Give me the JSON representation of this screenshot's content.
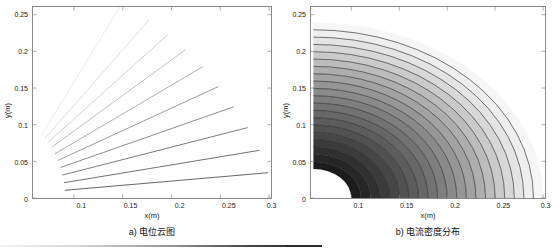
{
  "figure": {
    "width": 557,
    "height": 249,
    "background": "#ffffff",
    "line_color": "#3c3c3c",
    "axis_color": "#8a8a8a",
    "text_color": "#1a1a1a"
  },
  "panels": [
    {
      "id": "a",
      "caption": "a) 电位云图",
      "xlabel": "x(m)",
      "ylabel": "y(m)",
      "xticks": [
        "0.1",
        "0.15",
        "0.2",
        "0.25",
        "0.3"
      ],
      "yticks": [
        "0",
        "0.05",
        "0.1",
        "0.15",
        "0.2",
        "0.25"
      ]
    },
    {
      "id": "b",
      "caption": "b) 电流密度分布",
      "xlabel": "x(m)",
      "ylabel": "y(m)",
      "xticks": [
        "0.1",
        "0.15",
        "0.2",
        "0.25",
        "0.3"
      ],
      "yticks": [
        "0",
        "0.05",
        "0.1",
        "0.15",
        "0.2",
        "0.25"
      ]
    }
  ],
  "chart_data": [
    {
      "type": "line",
      "title": "a) 电位云图",
      "xlabel": "x(m)",
      "ylabel": "y(m)",
      "xlim": [
        0.058,
        0.302
      ],
      "ylim": [
        0.0,
        0.2605
      ],
      "grid": false,
      "legend": "none",
      "description": "Equipotential / field lines: ten straight rays fanning out from a common source region near the inner electrode radius; line gray value lightens with increasing angle.",
      "origin": [
        0.0605,
        0.0
      ],
      "inner_radius": 0.0305,
      "series": [
        {
          "name": "ray-1",
          "angle_deg": 8,
          "gray": "#4a4a4a",
          "x": [
            0.0905,
            0.299
          ],
          "y": [
            0.0105,
            0.0345
          ]
        },
        {
          "name": "ray-2",
          "angle_deg": 16,
          "gray": "#565656",
          "x": [
            0.0897,
            0.29
          ],
          "y": [
            0.0208,
            0.065
          ]
        },
        {
          "name": "ray-3",
          "angle_deg": 25,
          "gray": "#646464",
          "x": [
            0.0882,
            0.278
          ],
          "y": [
            0.0313,
            0.096
          ]
        },
        {
          "name": "ray-4",
          "angle_deg": 33,
          "gray": "#757575",
          "x": [
            0.0862,
            0.264
          ],
          "y": [
            0.0416,
            0.1245
          ]
        },
        {
          "name": "ray-5",
          "angle_deg": 41,
          "gray": "#8a8a8a",
          "x": [
            0.0835,
            0.248
          ],
          "y": [
            0.0512,
            0.152
          ]
        },
        {
          "name": "ray-6",
          "angle_deg": 49,
          "gray": "#a0a0a0",
          "x": [
            0.0805,
            0.232
          ],
          "y": [
            0.0603,
            0.179
          ]
        },
        {
          "name": "ray-7",
          "angle_deg": 57,
          "gray": "#b4b4b4",
          "x": [
            0.077,
            0.214
          ],
          "y": [
            0.069,
            0.202
          ]
        },
        {
          "name": "ray-8",
          "angle_deg": 65,
          "gray": "#c8c8c8",
          "x": [
            0.0735,
            0.196
          ],
          "y": [
            0.076,
            0.2225
          ]
        },
        {
          "name": "ray-9",
          "angle_deg": 72,
          "gray": "#d8d8d8",
          "x": [
            0.07,
            0.177
          ],
          "y": [
            0.081,
            0.243
          ]
        },
        {
          "name": "ray-10",
          "angle_deg": 80,
          "gray": "#e6e6e6",
          "x": [
            0.0665,
            0.147
          ],
          "y": [
            0.085,
            0.2605
          ]
        }
      ]
    },
    {
      "type": "contour",
      "title": "b) 电流密度分布",
      "xlabel": "x(m)",
      "ylabel": "y(m)",
      "xlim": [
        0.058,
        0.302
      ],
      "ylim": [
        0.0,
        0.2605
      ],
      "grid": false,
      "legend": "none",
      "description": "Filled contour map of current density over a quarter-annulus sector. Density is highest (darkest) at the inner electrode radius and decays monotonically outward to near-white at the outer boundary. Twenty concentric arc contour lines are overlaid.",
      "center": [
        0.0605,
        0.0
      ],
      "inner_radius": 0.0395,
      "outer_radius": 0.2395,
      "angle_range_deg": [
        0,
        90
      ],
      "n_contour_lines": 20,
      "bands": [
        {
          "r_outer": 0.0495,
          "fill": "#1c1c1c"
        },
        {
          "r_outer": 0.0595,
          "fill": "#262626"
        },
        {
          "r_outer": 0.0695,
          "fill": "#303030"
        },
        {
          "r_outer": 0.0795,
          "fill": "#3b3b3b"
        },
        {
          "r_outer": 0.0895,
          "fill": "#464646"
        },
        {
          "r_outer": 0.0995,
          "fill": "#515151"
        },
        {
          "r_outer": 0.1095,
          "fill": "#5c5c5c"
        },
        {
          "r_outer": 0.1195,
          "fill": "#676767"
        },
        {
          "r_outer": 0.1295,
          "fill": "#727272"
        },
        {
          "r_outer": 0.1395,
          "fill": "#7e7e7e"
        },
        {
          "r_outer": 0.1495,
          "fill": "#8a8a8a"
        },
        {
          "r_outer": 0.1595,
          "fill": "#969696"
        },
        {
          "r_outer": 0.1695,
          "fill": "#a2a2a2"
        },
        {
          "r_outer": 0.1795,
          "fill": "#aeaeae"
        },
        {
          "r_outer": 0.1895,
          "fill": "#bcbcbc"
        },
        {
          "r_outer": 0.1995,
          "fill": "#cacaca"
        },
        {
          "r_outer": 0.2095,
          "fill": "#d8d8d8"
        },
        {
          "r_outer": 0.2195,
          "fill": "#e4e4e4"
        },
        {
          "r_outer": 0.2295,
          "fill": "#eeeeee"
        },
        {
          "r_outer": 0.2395,
          "fill": "#f6f6f6"
        }
      ]
    }
  ]
}
